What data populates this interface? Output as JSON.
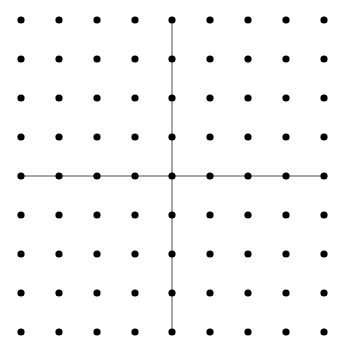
{
  "diagram": {
    "type": "dot-grid-with-axes",
    "grid": {
      "columns": 9,
      "rows": 9,
      "x_positions": [
        21,
        59,
        97,
        135,
        172,
        210,
        248,
        286,
        324
      ],
      "y_positions": [
        20,
        59,
        98,
        137,
        176,
        215,
        254,
        293,
        332
      ],
      "dot_radius": 3.6,
      "dot_color": "#000000"
    },
    "axes": {
      "color": "#8a8a8a",
      "width": 1.5,
      "horizontal": {
        "x1": 21,
        "x2": 324,
        "y": 176
      },
      "vertical": {
        "x": 172,
        "y1": 20,
        "y2": 332
      }
    }
  }
}
